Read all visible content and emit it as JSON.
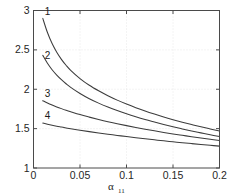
{
  "chart_data": {
    "type": "line",
    "title": "",
    "subtitle": "",
    "xlabel": "α",
    "xlabel_sub": "11",
    "ylabel": "",
    "xlim": [
      0,
      0.2
    ],
    "ylim": [
      1,
      3
    ],
    "grid": true,
    "grid_style": "dotted",
    "legend": "inline-curve-numbers",
    "legend_position": "left-of-curve-start",
    "xticks": [
      0,
      0.05,
      0.1,
      0.15,
      0.2
    ],
    "xticklabels": [
      "0",
      "0.05",
      "0.1",
      "0.15",
      "0.2"
    ],
    "yticks": [
      1,
      1.5,
      2,
      2.5,
      3
    ],
    "yticklabels": [
      "1",
      "1.5",
      "2",
      "2.5",
      "3"
    ],
    "series": [
      {
        "name": "1",
        "label": "1",
        "color": "#3c3c3c",
        "x": [
          0.01,
          0.015,
          0.02,
          0.025,
          0.03,
          0.035,
          0.04,
          0.05,
          0.06,
          0.07,
          0.08,
          0.09,
          0.1,
          0.11,
          0.12,
          0.13,
          0.14,
          0.15,
          0.16,
          0.17,
          0.18,
          0.19,
          0.2
        ],
        "y": [
          2.9,
          2.72,
          2.58,
          2.47,
          2.38,
          2.305,
          2.24,
          2.135,
          2.05,
          1.98,
          1.918,
          1.862,
          1.812,
          1.766,
          1.724,
          1.685,
          1.648,
          1.614,
          1.582,
          1.552,
          1.523,
          1.496,
          1.47
        ]
      },
      {
        "name": "2",
        "label": "2",
        "color": "#3c3c3c",
        "x": [
          0.01,
          0.015,
          0.02,
          0.025,
          0.03,
          0.035,
          0.04,
          0.05,
          0.06,
          0.07,
          0.08,
          0.09,
          0.1,
          0.11,
          0.12,
          0.13,
          0.14,
          0.15,
          0.16,
          0.17,
          0.18,
          0.19,
          0.2
        ],
        "y": [
          2.43,
          2.33,
          2.248,
          2.18,
          2.122,
          2.07,
          2.024,
          1.946,
          1.88,
          1.824,
          1.774,
          1.729,
          1.688,
          1.65,
          1.615,
          1.583,
          1.552,
          1.523,
          1.496,
          1.47,
          1.446,
          1.422,
          1.4
        ]
      },
      {
        "name": "3",
        "label": "3",
        "color": "#3c3c3c",
        "x": [
          0.01,
          0.015,
          0.02,
          0.025,
          0.03,
          0.035,
          0.04,
          0.05,
          0.06,
          0.07,
          0.08,
          0.09,
          0.1,
          0.11,
          0.12,
          0.13,
          0.14,
          0.15,
          0.16,
          0.17,
          0.18,
          0.19,
          0.2
        ],
        "y": [
          1.855,
          1.826,
          1.8,
          1.776,
          1.754,
          1.733,
          1.714,
          1.678,
          1.646,
          1.616,
          1.588,
          1.562,
          1.538,
          1.515,
          1.493,
          1.472,
          1.452,
          1.433,
          1.415,
          1.397,
          1.38,
          1.364,
          1.348
        ]
      },
      {
        "name": "4",
        "label": "4",
        "color": "#3c3c3c",
        "x": [
          0.01,
          0.015,
          0.02,
          0.025,
          0.03,
          0.035,
          0.04,
          0.05,
          0.06,
          0.07,
          0.08,
          0.09,
          0.1,
          0.11,
          0.12,
          0.13,
          0.14,
          0.15,
          0.16,
          0.17,
          0.18,
          0.19,
          0.2
        ],
        "y": [
          1.57,
          1.556,
          1.543,
          1.531,
          1.52,
          1.509,
          1.499,
          1.48,
          1.462,
          1.445,
          1.429,
          1.414,
          1.399,
          1.385,
          1.371,
          1.358,
          1.345,
          1.333,
          1.321,
          1.31,
          1.299,
          1.288,
          1.278
        ]
      }
    ],
    "curve_labels": [
      {
        "text": "1",
        "x": 0.012,
        "y": 2.945
      },
      {
        "text": "2",
        "x": 0.012,
        "y": 2.39
      },
      {
        "text": "3",
        "x": 0.012,
        "y": 1.905
      },
      {
        "text": "4",
        "x": 0.012,
        "y": 1.625
      }
    ]
  },
  "colors": {
    "curve": "#3c3c3c",
    "axis": "#4a4a4a",
    "grid": "#e2e2e2",
    "text": "#1a1a1a",
    "background": "#ffffff"
  }
}
